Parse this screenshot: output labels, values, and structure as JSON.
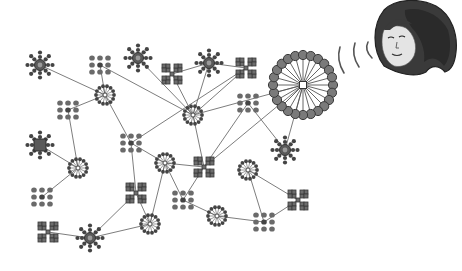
{
  "figure": {
    "description": "Network diagram of heterogeneous nodes linked by edges, with a large hub broadcasting toward a face illustration",
    "colors": {
      "node_dark": "#444444",
      "node_block": "#6d6d6d",
      "edge": "#6e6e6e",
      "background": "#ffffff",
      "face_hair": "#3a3a3a",
      "face_skin": "#e4e4e4"
    }
  },
  "nodes": [
    {
      "id": "n1",
      "type": "sun",
      "x": 40,
      "y": 65
    },
    {
      "id": "n2",
      "type": "grid",
      "x": 100,
      "y": 65
    },
    {
      "id": "n3",
      "type": "sun",
      "x": 138,
      "y": 58
    },
    {
      "id": "n4",
      "type": "x",
      "x": 172,
      "y": 74
    },
    {
      "id": "n5",
      "type": "sun",
      "x": 209,
      "y": 63
    },
    {
      "id": "n6",
      "type": "x",
      "x": 246,
      "y": 68
    },
    {
      "id": "n7",
      "type": "burst",
      "x": 105,
      "y": 95
    },
    {
      "id": "n8",
      "type": "grid",
      "x": 68,
      "y": 110
    },
    {
      "id": "n9",
      "type": "burst",
      "x": 193,
      "y": 115
    },
    {
      "id": "n10",
      "type": "grid",
      "x": 248,
      "y": 103
    },
    {
      "id": "n11",
      "type": "sunx",
      "x": 40,
      "y": 145
    },
    {
      "id": "n12",
      "type": "grid",
      "x": 131,
      "y": 143
    },
    {
      "id": "n13",
      "type": "sun",
      "x": 285,
      "y": 150
    },
    {
      "id": "n14",
      "type": "burst",
      "x": 78,
      "y": 168
    },
    {
      "id": "n15",
      "type": "burst",
      "x": 165,
      "y": 163
    },
    {
      "id": "n16",
      "type": "x",
      "x": 204,
      "y": 167
    },
    {
      "id": "n17",
      "type": "burst",
      "x": 248,
      "y": 170
    },
    {
      "id": "n18",
      "type": "grid",
      "x": 42,
      "y": 197
    },
    {
      "id": "n19",
      "type": "x",
      "x": 136,
      "y": 193
    },
    {
      "id": "n20",
      "type": "grid",
      "x": 183,
      "y": 200
    },
    {
      "id": "n21",
      "type": "x",
      "x": 298,
      "y": 200
    },
    {
      "id": "n22",
      "type": "burst",
      "x": 150,
      "y": 224
    },
    {
      "id": "n23",
      "type": "burst",
      "x": 217,
      "y": 216
    },
    {
      "id": "n24",
      "type": "grid",
      "x": 264,
      "y": 222
    },
    {
      "id": "n25",
      "type": "x",
      "x": 48,
      "y": 232
    },
    {
      "id": "n26",
      "type": "sun",
      "x": 90,
      "y": 238
    }
  ],
  "hub": {
    "id": "hub",
    "x": 303,
    "y": 85,
    "radius": 30,
    "spokes": 24
  },
  "edges": [
    [
      "n1",
      "n7"
    ],
    [
      "n2",
      "n7"
    ],
    [
      "n2",
      "n9"
    ],
    [
      "n3",
      "n9"
    ],
    [
      "n4",
      "n5"
    ],
    [
      "n4",
      "n9"
    ],
    [
      "n5",
      "n6"
    ],
    [
      "n5",
      "n9"
    ],
    [
      "n6",
      "n9"
    ],
    [
      "n6",
      "n12"
    ],
    [
      "n7",
      "n8"
    ],
    [
      "n7",
      "n12"
    ],
    [
      "n8",
      "n14"
    ],
    [
      "n11",
      "n14"
    ],
    [
      "n12",
      "n15"
    ],
    [
      "n12",
      "n19"
    ],
    [
      "n10",
      "n16"
    ],
    [
      "n10",
      "n13"
    ],
    [
      "n15",
      "n16"
    ],
    [
      "n9",
      "n16"
    ],
    [
      "n15",
      "n20"
    ],
    [
      "n16",
      "n20"
    ],
    [
      "n19",
      "n22"
    ],
    [
      "n19",
      "n26"
    ],
    [
      "n15",
      "n22"
    ],
    [
      "n22",
      "n26"
    ],
    [
      "n26",
      "n25"
    ],
    [
      "n20",
      "n23"
    ],
    [
      "n23",
      "n24"
    ],
    [
      "n17",
      "n24"
    ],
    [
      "n17",
      "n21"
    ],
    [
      "n21",
      "n24"
    ],
    [
      "n14",
      "n18"
    ],
    [
      "hub",
      "n13"
    ],
    [
      "hub",
      "n16"
    ],
    [
      "n9",
      "hub"
    ]
  ],
  "waves": [
    {
      "x": 340,
      "y": 60,
      "h": 26
    },
    {
      "x": 355,
      "y": 55,
      "h": 24
    },
    {
      "x": 368,
      "y": 50,
      "h": 16
    }
  ],
  "face": {
    "x": 372,
    "y": 0,
    "w": 88,
    "h": 80,
    "label": "face-illustration"
  }
}
